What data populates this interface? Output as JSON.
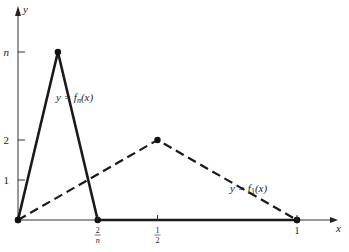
{
  "chart_data": {
    "type": "line",
    "title": "",
    "xlabel": "x",
    "ylabel": "y",
    "xlim": [
      0,
      1.08
    ],
    "ylim": [
      0,
      5.2
    ],
    "x_ticks": [
      {
        "value": 0.2857,
        "label_num": "2",
        "label_den": "n"
      },
      {
        "value": 0.5,
        "label_num": "1",
        "label_den": "2"
      },
      {
        "value": 1,
        "label": "1"
      }
    ],
    "y_ticks": [
      {
        "value": 1,
        "label": "1"
      },
      {
        "value": 2,
        "label": "2"
      },
      {
        "value": 4.2,
        "label": "n"
      }
    ],
    "series": [
      {
        "name": "fn",
        "label": "y = f_n(x)",
        "style": "solid",
        "points": [
          [
            0,
            0
          ],
          [
            0.1429,
            4.2
          ],
          [
            0.2857,
            0
          ],
          [
            1,
            0
          ]
        ]
      },
      {
        "name": "f1",
        "label": "y = f_1(x)",
        "style": "dashed",
        "points": [
          [
            0,
            0
          ],
          [
            0.5,
            2
          ],
          [
            1,
            0
          ]
        ]
      }
    ],
    "annotations": [
      {
        "text": "y = f",
        "sub": "n",
        "suffix": "(x)",
        "near_series": "fn"
      },
      {
        "text": "y = f",
        "sub": "1",
        "suffix": "(x)",
        "near_series": "f1"
      }
    ],
    "grid": false,
    "legend": "none"
  }
}
